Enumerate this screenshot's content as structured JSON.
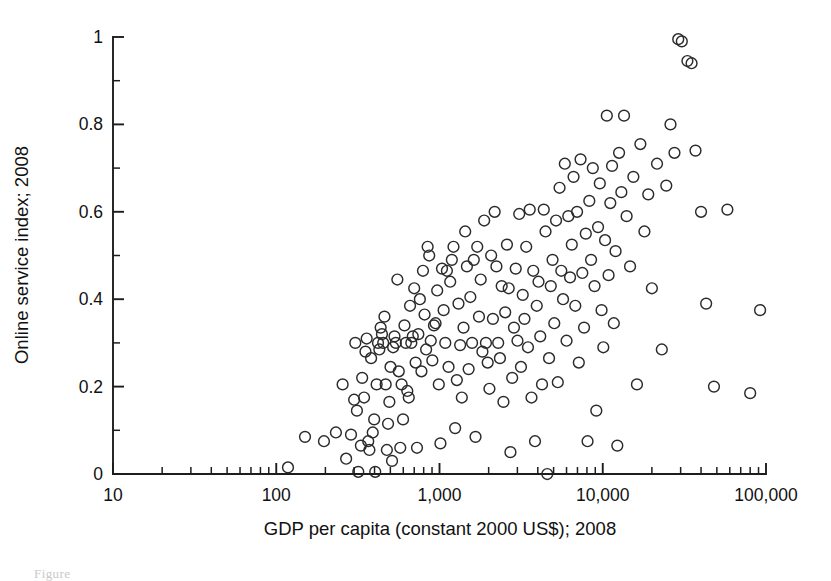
{
  "figure": {
    "caption_fragment": "Figure"
  },
  "chart_data": {
    "type": "scatter",
    "title": "",
    "xlabel": "GDP per capita (constant 2000 US$); 2008",
    "ylabel": "Online service index; 2008",
    "xscale": "log",
    "yscale": "linear",
    "xlim": [
      10,
      100000
    ],
    "ylim": [
      0,
      1
    ],
    "grid": false,
    "legend": null,
    "xticks": [
      10,
      100,
      1000,
      10000,
      100000
    ],
    "xtick_labels": [
      "10",
      "100",
      "1,000",
      "10,000",
      "100,000"
    ],
    "yticks": [
      0,
      0.2,
      0.4,
      0.6,
      0.8,
      1
    ],
    "ytick_labels": [
      "0",
      "0.2",
      "0.4",
      "0.6",
      "0.8",
      "1"
    ],
    "y_minor_ticks": [
      0.1,
      0.3,
      0.5,
      0.7,
      0.9
    ],
    "marker": {
      "shape": "circle-open",
      "edge_color": "#2b2b2b",
      "face_color": "none",
      "radius_px": 5.4
    },
    "n_points": 190,
    "points": [
      [
        118,
        0.015
      ],
      [
        150,
        0.085
      ],
      [
        196,
        0.075
      ],
      [
        232,
        0.095
      ],
      [
        255,
        0.205
      ],
      [
        268,
        0.035
      ],
      [
        287,
        0.09
      ],
      [
        300,
        0.17
      ],
      [
        305,
        0.3
      ],
      [
        312,
        0.145
      ],
      [
        318,
        0.005
      ],
      [
        330,
        0.065
      ],
      [
        336,
        0.22
      ],
      [
        345,
        0.175
      ],
      [
        352,
        0.28
      ],
      [
        358,
        0.31
      ],
      [
        366,
        0.075
      ],
      [
        372,
        0.055
      ],
      [
        381,
        0.265
      ],
      [
        390,
        0.095
      ],
      [
        398,
        0.125
      ],
      [
        404,
        0.005
      ],
      [
        412,
        0.205
      ],
      [
        420,
        0.3
      ],
      [
        428,
        0.285
      ],
      [
        436,
        0.335
      ],
      [
        444,
        0.32
      ],
      [
        452,
        0.3
      ],
      [
        460,
        0.36
      ],
      [
        468,
        0.205
      ],
      [
        476,
        0.055
      ],
      [
        484,
        0.115
      ],
      [
        493,
        0.165
      ],
      [
        501,
        0.245
      ],
      [
        512,
        0.03
      ],
      [
        520,
        0.29
      ],
      [
        530,
        0.315
      ],
      [
        540,
        0.3
      ],
      [
        552,
        0.445
      ],
      [
        563,
        0.235
      ],
      [
        575,
        0.06
      ],
      [
        586,
        0.205
      ],
      [
        598,
        0.125
      ],
      [
        610,
        0.34
      ],
      [
        622,
        0.3
      ],
      [
        635,
        0.19
      ],
      [
        648,
        0.175
      ],
      [
        660,
        0.385
      ],
      [
        672,
        0.3
      ],
      [
        686,
        0.315
      ],
      [
        700,
        0.425
      ],
      [
        714,
        0.255
      ],
      [
        728,
        0.06
      ],
      [
        742,
        0.32
      ],
      [
        758,
        0.4
      ],
      [
        775,
        0.235
      ],
      [
        792,
        0.465
      ],
      [
        810,
        0.365
      ],
      [
        828,
        0.285
      ],
      [
        846,
        0.52
      ],
      [
        865,
        0.5
      ],
      [
        884,
        0.305
      ],
      [
        904,
        0.26
      ],
      [
        925,
        0.34
      ],
      [
        946,
        0.345
      ],
      [
        968,
        0.42
      ],
      [
        990,
        0.205
      ],
      [
        1013,
        0.07
      ],
      [
        1036,
        0.47
      ],
      [
        1060,
        0.375
      ],
      [
        1085,
        0.3
      ],
      [
        1110,
        0.465
      ],
      [
        1136,
        0.245
      ],
      [
        1163,
        0.44
      ],
      [
        1190,
        0.49
      ],
      [
        1218,
        0.52
      ],
      [
        1247,
        0.105
      ],
      [
        1277,
        0.215
      ],
      [
        1307,
        0.39
      ],
      [
        1338,
        0.295
      ],
      [
        1370,
        0.175
      ],
      [
        1403,
        0.335
      ],
      [
        1437,
        0.555
      ],
      [
        1472,
        0.475
      ],
      [
        1508,
        0.24
      ],
      [
        1545,
        0.405
      ],
      [
        1583,
        0.3
      ],
      [
        1622,
        0.49
      ],
      [
        1662,
        0.085
      ],
      [
        1703,
        0.52
      ],
      [
        1745,
        0.36
      ],
      [
        1788,
        0.445
      ],
      [
        1832,
        0.28
      ],
      [
        1878,
        0.58
      ],
      [
        1925,
        0.3
      ],
      [
        1973,
        0.255
      ],
      [
        2022,
        0.195
      ],
      [
        2072,
        0.5
      ],
      [
        2124,
        0.355
      ],
      [
        2177,
        0.6
      ],
      [
        2232,
        0.475
      ],
      [
        2288,
        0.3
      ],
      [
        2345,
        0.265
      ],
      [
        2404,
        0.43
      ],
      [
        2464,
        0.165
      ],
      [
        2526,
        0.37
      ],
      [
        2589,
        0.525
      ],
      [
        2654,
        0.425
      ],
      [
        2720,
        0.05
      ],
      [
        2788,
        0.22
      ],
      [
        2858,
        0.335
      ],
      [
        2930,
        0.47
      ],
      [
        3003,
        0.305
      ],
      [
        3078,
        0.595
      ],
      [
        3155,
        0.245
      ],
      [
        3234,
        0.41
      ],
      [
        3315,
        0.355
      ],
      [
        3398,
        0.52
      ],
      [
        3483,
        0.29
      ],
      [
        3570,
        0.605
      ],
      [
        3660,
        0.175
      ],
      [
        3752,
        0.465
      ],
      [
        3846,
        0.075
      ],
      [
        3942,
        0.385
      ],
      [
        4041,
        0.44
      ],
      [
        4142,
        0.315
      ],
      [
        4246,
        0.205
      ],
      [
        4352,
        0.605
      ],
      [
        4461,
        0.555
      ],
      [
        4573,
        0.0
      ],
      [
        4688,
        0.265
      ],
      [
        4805,
        0.43
      ],
      [
        4925,
        0.49
      ],
      [
        5048,
        0.345
      ],
      [
        5175,
        0.58
      ],
      [
        5304,
        0.21
      ],
      [
        5437,
        0.655
      ],
      [
        5573,
        0.465
      ],
      [
        5712,
        0.4
      ],
      [
        5855,
        0.71
      ],
      [
        6001,
        0.305
      ],
      [
        6151,
        0.59
      ],
      [
        6305,
        0.45
      ],
      [
        6463,
        0.525
      ],
      [
        6624,
        0.68
      ],
      [
        6790,
        0.385
      ],
      [
        6960,
        0.6
      ],
      [
        7134,
        0.255
      ],
      [
        7312,
        0.72
      ],
      [
        7495,
        0.46
      ],
      [
        7682,
        0.335
      ],
      [
        7874,
        0.55
      ],
      [
        8071,
        0.075
      ],
      [
        8273,
        0.625
      ],
      [
        8480,
        0.49
      ],
      [
        8692,
        0.7
      ],
      [
        8909,
        0.43
      ],
      [
        9132,
        0.145
      ],
      [
        9360,
        0.565
      ],
      [
        9594,
        0.665
      ],
      [
        9834,
        0.375
      ],
      [
        10080,
        0.29
      ],
      [
        10332,
        0.535
      ],
      [
        10590,
        0.82
      ],
      [
        10855,
        0.455
      ],
      [
        11126,
        0.62
      ],
      [
        11404,
        0.705
      ],
      [
        11689,
        0.345
      ],
      [
        11981,
        0.51
      ],
      [
        12281,
        0.065
      ],
      [
        12588,
        0.735
      ],
      [
        13000,
        0.645
      ],
      [
        13500,
        0.82
      ],
      [
        14000,
        0.59
      ],
      [
        14700,
        0.475
      ],
      [
        15400,
        0.68
      ],
      [
        16200,
        0.205
      ],
      [
        17000,
        0.755
      ],
      [
        18000,
        0.555
      ],
      [
        19000,
        0.64
      ],
      [
        20000,
        0.425
      ],
      [
        21500,
        0.71
      ],
      [
        23000,
        0.285
      ],
      [
        24500,
        0.66
      ],
      [
        26000,
        0.8
      ],
      [
        27500,
        0.735
      ],
      [
        29000,
        0.995
      ],
      [
        30500,
        0.99
      ],
      [
        33000,
        0.945
      ],
      [
        35000,
        0.94
      ],
      [
        37000,
        0.74
      ],
      [
        40000,
        0.6
      ],
      [
        43000,
        0.39
      ],
      [
        48000,
        0.2
      ],
      [
        58000,
        0.605
      ],
      [
        80000,
        0.185
      ],
      [
        92000,
        0.375
      ]
    ]
  }
}
